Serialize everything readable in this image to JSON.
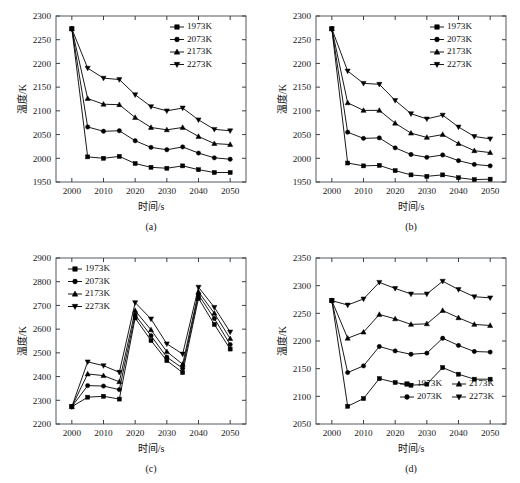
{
  "figure": {
    "background": "#ffffff",
    "series_color": "#000000",
    "axis_color": "#555a5e",
    "panel_count": 4
  },
  "labels": {
    "xlabel": "时间/s",
    "ylabel": "温度/K",
    "caption_a": "(a)",
    "caption_b": "(b)",
    "caption_c": "(c)",
    "caption_d": "(d)"
  },
  "legend_entries": [
    {
      "label": "1973K",
      "marker": "square"
    },
    {
      "label": "2073K",
      "marker": "circle"
    },
    {
      "label": "2173K",
      "marker": "triangle-up"
    },
    {
      "label": "2273K",
      "marker": "triangle-down"
    }
  ],
  "chart_data": [
    {
      "id": "a",
      "type": "line",
      "title": "(a)",
      "xlabel": "时间/s",
      "ylabel": "温度/K",
      "xlim": [
        1995,
        2055
      ],
      "ylim": [
        1950,
        2300
      ],
      "xticks": [
        2000,
        2010,
        2020,
        2030,
        2040,
        2050
      ],
      "yticks": [
        1950,
        2000,
        2050,
        2100,
        2150,
        2200,
        2250,
        2300
      ],
      "grid": false,
      "legend_position": "upper-right",
      "x": [
        2000,
        2005,
        2010,
        2015,
        2020,
        2025,
        2030,
        2035,
        2040,
        2045,
        2050
      ],
      "series": [
        {
          "name": "1973K",
          "marker": "square",
          "values": [
            2273,
            2003,
            2000,
            2004,
            1989,
            1981,
            1979,
            1984,
            1976,
            1970,
            1970
          ]
        },
        {
          "name": "2073K",
          "marker": "circle",
          "values": [
            2273,
            2066,
            2057,
            2058,
            2037,
            2023,
            2018,
            2024,
            2011,
            2001,
            1998
          ]
        },
        {
          "name": "2173K",
          "marker": "triangle-up",
          "values": [
            2273,
            2126,
            2114,
            2113,
            2086,
            2065,
            2060,
            2065,
            2046,
            2031,
            2029
          ]
        },
        {
          "name": "2273K",
          "marker": "triangle-down",
          "values": [
            2273,
            2190,
            2169,
            2166,
            2134,
            2109,
            2100,
            2106,
            2081,
            2061,
            2058
          ]
        }
      ]
    },
    {
      "id": "b",
      "type": "line",
      "title": "(b)",
      "xlabel": "时间/s",
      "ylabel": "温度/K",
      "xlim": [
        1995,
        2055
      ],
      "ylim": [
        1950,
        2300
      ],
      "xticks": [
        2000,
        2010,
        2020,
        2030,
        2040,
        2050
      ],
      "yticks": [
        1950,
        2000,
        2050,
        2100,
        2150,
        2200,
        2250,
        2300
      ],
      "grid": false,
      "legend_position": "upper-right",
      "x": [
        2000,
        2005,
        2010,
        2015,
        2020,
        2025,
        2030,
        2035,
        2040,
        2045,
        2050
      ],
      "series": [
        {
          "name": "1973K",
          "marker": "square",
          "values": [
            2273,
            1990,
            1984,
            1985,
            1974,
            1965,
            1962,
            1965,
            1959,
            1955,
            1956
          ]
        },
        {
          "name": "2073K",
          "marker": "circle",
          "values": [
            2273,
            2055,
            2042,
            2043,
            2022,
            2008,
            2002,
            2007,
            1995,
            1987,
            1984
          ]
        },
        {
          "name": "2173K",
          "marker": "triangle-up",
          "values": [
            2273,
            2117,
            2101,
            2101,
            2074,
            2053,
            2044,
            2050,
            2031,
            2016,
            2012
          ]
        },
        {
          "name": "2273K",
          "marker": "triangle-down",
          "values": [
            2273,
            2184,
            2158,
            2156,
            2122,
            2094,
            2083,
            2091,
            2066,
            2046,
            2041
          ]
        }
      ]
    },
    {
      "id": "c",
      "type": "line",
      "title": "(c)",
      "xlabel": "时间/s",
      "ylabel": "温度/K",
      "xlim": [
        1995,
        2055
      ],
      "ylim": [
        2200,
        2900
      ],
      "xticks": [
        2000,
        2010,
        2020,
        2030,
        2040,
        2050
      ],
      "yticks": [
        2200,
        2300,
        2400,
        2500,
        2600,
        2700,
        2800,
        2900
      ],
      "grid": false,
      "legend_position": "upper-left",
      "x": [
        2000,
        2005,
        2010,
        2015,
        2020,
        2025,
        2030,
        2035,
        2040,
        2045,
        2050
      ],
      "series": [
        {
          "name": "1973K",
          "marker": "square",
          "values": [
            2273,
            2313,
            2317,
            2305,
            2647,
            2552,
            2467,
            2417,
            2730,
            2620,
            2516
          ]
        },
        {
          "name": "2073K",
          "marker": "circle",
          "values": [
            2273,
            2362,
            2360,
            2345,
            2660,
            2572,
            2482,
            2435,
            2745,
            2645,
            2535
          ]
        },
        {
          "name": "2173K",
          "marker": "triangle-up",
          "values": [
            2273,
            2411,
            2404,
            2378,
            2678,
            2597,
            2505,
            2452,
            2757,
            2667,
            2560
          ]
        },
        {
          "name": "2273K",
          "marker": "triangle-down",
          "values": [
            2273,
            2462,
            2446,
            2418,
            2712,
            2643,
            2538,
            2495,
            2777,
            2692,
            2588
          ]
        }
      ]
    },
    {
      "id": "d",
      "type": "line",
      "title": "(d)",
      "xlabel": "时间/s",
      "ylabel": "温度/K",
      "xlim": [
        1995,
        2055
      ],
      "ylim": [
        2050,
        2350
      ],
      "xticks": [
        2000,
        2010,
        2020,
        2030,
        2040,
        2050
      ],
      "yticks": [
        2050,
        2100,
        2150,
        2200,
        2250,
        2300,
        2350
      ],
      "grid": false,
      "legend_position": "lower-right",
      "x": [
        2000,
        2005,
        2010,
        2015,
        2020,
        2025,
        2030,
        2035,
        2040,
        2045,
        2050
      ],
      "series": [
        {
          "name": "1973K",
          "marker": "square",
          "values": [
            2273,
            2082,
            2096,
            2132,
            2125,
            2120,
            2122,
            2152,
            2140,
            2131,
            2131
          ]
        },
        {
          "name": "2073K",
          "marker": "circle",
          "values": [
            2273,
            2143,
            2155,
            2190,
            2182,
            2176,
            2178,
            2205,
            2192,
            2181,
            2180
          ]
        },
        {
          "name": "2173K",
          "marker": "triangle-up",
          "values": [
            2273,
            2205,
            2216,
            2248,
            2240,
            2230,
            2231,
            2255,
            2242,
            2230,
            2228
          ]
        },
        {
          "name": "2273K",
          "marker": "triangle-down",
          "values": [
            2273,
            2265,
            2276,
            2306,
            2295,
            2285,
            2285,
            2308,
            2293,
            2280,
            2278
          ]
        }
      ]
    }
  ]
}
